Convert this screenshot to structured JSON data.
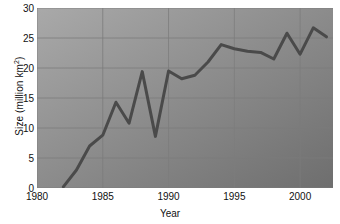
{
  "chart_data": {
    "type": "line",
    "title": "",
    "xlabel": "Year",
    "ylabel": "Size (million km2)",
    "ylabel_display": "Size (million km",
    "ylabel_unit_sup": "2",
    "ylabel_tail": ")",
    "xlim": [
      1980,
      2002.5
    ],
    "ylim": [
      0,
      30
    ],
    "grid": true,
    "legend": false,
    "xticks": [
      1980,
      1985,
      1990,
      1995,
      2000
    ],
    "xtick_labels": [
      "1980",
      "1985",
      "1990",
      "1995",
      "2000"
    ],
    "yticks": [
      0,
      5,
      10,
      15,
      20,
      25,
      30
    ],
    "ytick_labels": [
      "0",
      "5",
      "10",
      "15",
      "20",
      "25",
      "30"
    ],
    "x": [
      1982,
      1983,
      1984,
      1985,
      1986,
      1987,
      1988,
      1989,
      1990,
      1991,
      1992,
      1993,
      1994,
      1995,
      1996,
      1997,
      1998,
      1999,
      2000,
      2001,
      2002
    ],
    "values": [
      0.2,
      3.0,
      7.0,
      8.8,
      14.3,
      10.8,
      19.4,
      8.6,
      19.5,
      18.2,
      18.8,
      21.0,
      23.9,
      23.2,
      22.8,
      22.6,
      21.5,
      25.8,
      22.3,
      26.7,
      25.2
    ],
    "series": [
      {
        "name": "Ozone hole size",
        "values": [
          0.2,
          3.0,
          7.0,
          8.8,
          14.3,
          10.8,
          19.4,
          8.6,
          19.5,
          18.2,
          18.8,
          21.0,
          23.9,
          23.2,
          22.8,
          22.6,
          21.5,
          25.8,
          22.3,
          26.7,
          25.2
        ]
      }
    ],
    "colors": {
      "line": "#4a4a4a",
      "grid": "#7c7c7c",
      "background_top_left": "#a9a9a9",
      "background_bottom_right": "#6e6e6e",
      "text": "#111111"
    },
    "line_width": 3
  }
}
